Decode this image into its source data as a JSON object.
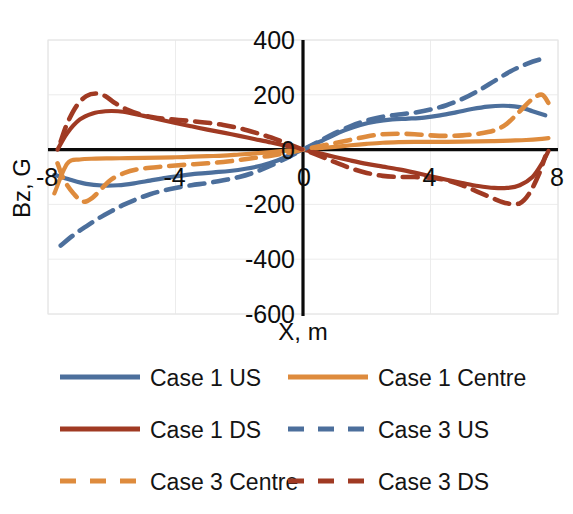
{
  "title_cut_off": "",
  "chart_data": {
    "type": "line",
    "title": "",
    "xlabel": "X, m",
    "ylabel": "Bz, G",
    "xlim": [
      -8,
      8
    ],
    "ylim": [
      -600,
      400
    ],
    "xticks": [
      "-8",
      "-4",
      "0",
      "4",
      "8"
    ],
    "xtick_values": [
      -8,
      -4,
      0,
      4,
      8
    ],
    "yticks": [
      "400",
      "200",
      "0",
      "-200",
      "-400",
      "-600"
    ],
    "ytick_values": [
      400,
      200,
      0,
      -200,
      -400,
      -600
    ],
    "grid": true,
    "legend_position": "bottom",
    "colors": {
      "blue": "#4C6F9C",
      "orange": "#DE8B3D",
      "darkred": "#A03A23"
    },
    "series": [
      {
        "name": "Case 1 US",
        "color": "#4C6F9C",
        "style": "solid",
        "x": [
          -7.8,
          -7.3,
          -6.8,
          -6.3,
          -5.8,
          -5.3,
          -4.8,
          -4.3,
          -3.8,
          -3.3,
          -2.8,
          -2.3,
          -1.8,
          -1.3,
          -0.8,
          -0.3,
          0,
          0.3,
          0.8,
          1.3,
          1.8,
          2.3,
          2.8,
          3.3,
          3.8,
          4.3,
          4.8,
          5.3,
          5.8,
          6.3,
          6.8,
          7.2,
          7.6
        ],
        "y": [
          -92,
          -110,
          -125,
          -131,
          -130,
          -123,
          -113,
          -103,
          -95,
          -88,
          -83,
          -78,
          -70,
          -58,
          -40,
          -14,
          0,
          16,
          44,
          70,
          90,
          103,
          110,
          113,
          117,
          125,
          136,
          148,
          157,
          160,
          155,
          140,
          125
        ]
      },
      {
        "name": "Case 1 Centre",
        "color": "#DE8B3D",
        "style": "solid",
        "x": [
          -7.8,
          -7.4,
          -7.0,
          -6.5,
          -6.0,
          -5.5,
          -5.0,
          -4.5,
          -4.0,
          -3.5,
          -3.0,
          -2.5,
          -2.0,
          -1.5,
          -1.0,
          -0.5,
          0,
          0.5,
          1.0,
          1.5,
          2.0,
          2.5,
          3.0,
          3.5,
          4.0,
          4.5,
          5.0,
          5.5,
          6.0,
          6.5,
          7.0,
          7.4,
          7.7
        ],
        "y": [
          -160,
          -52,
          -36,
          -33,
          -32,
          -31,
          -30,
          -29,
          -28,
          -26,
          -24,
          -22,
          -18,
          -14,
          -9,
          -4,
          0,
          5,
          10,
          16,
          21,
          25,
          27,
          28,
          28,
          28,
          29,
          30,
          31,
          33,
          35,
          38,
          42
        ]
      },
      {
        "name": "Case 1 DS",
        "color": "#A03A23",
        "style": "solid",
        "x": [
          -7.7,
          -7.4,
          -7.0,
          -6.6,
          -6.2,
          -5.8,
          -5.4,
          -5.0,
          -4.5,
          -4.0,
          -3.5,
          -3.0,
          -2.5,
          -2.0,
          -1.5,
          -1.0,
          -0.5,
          0,
          0.5,
          1.0,
          1.5,
          2.0,
          2.5,
          3.0,
          3.5,
          4.0,
          4.5,
          5.0,
          5.5,
          6.0,
          6.4,
          6.8,
          7.2,
          7.5,
          7.7
        ],
        "y": [
          0,
          60,
          110,
          132,
          140,
          140,
          133,
          123,
          110,
          97,
          85,
          73,
          62,
          50,
          38,
          26,
          13,
          0,
          -13,
          -27,
          -40,
          -52,
          -62,
          -72,
          -84,
          -97,
          -110,
          -122,
          -133,
          -140,
          -140,
          -130,
          -100,
          -50,
          -5
        ]
      },
      {
        "name": "Case 3 US",
        "color": "#4C6F9C",
        "style": "dashed",
        "x": [
          -7.6,
          -7.2,
          -6.8,
          -6.4,
          -6.0,
          -5.6,
          -5.2,
          -4.8,
          -4.4,
          -4.0,
          -3.5,
          -3.0,
          -2.5,
          -2.0,
          -1.5,
          -1.0,
          -0.5,
          0,
          0.5,
          1.0,
          1.5,
          2.0,
          2.5,
          3.0,
          3.5,
          4.0,
          4.5,
          5.0,
          5.5,
          6.0,
          6.5,
          7.0,
          7.4,
          7.6
        ],
        "y": [
          -350,
          -312,
          -280,
          -250,
          -224,
          -200,
          -180,
          -163,
          -150,
          -140,
          -130,
          -122,
          -112,
          -100,
          -82,
          -58,
          -30,
          0,
          30,
          60,
          86,
          106,
          120,
          128,
          135,
          146,
          162,
          185,
          215,
          250,
          285,
          312,
          328,
          330
        ]
      },
      {
        "name": "Case 3 Centre",
        "color": "#DE8B3D",
        "style": "dashed",
        "x": [
          -7.7,
          -7.5,
          -7.2,
          -6.9,
          -6.6,
          -6.3,
          -6.0,
          -5.6,
          -5.2,
          -4.8,
          -4.4,
          -4.0,
          -3.5,
          -3.0,
          -2.5,
          -2.0,
          -1.5,
          -1.0,
          -0.5,
          0,
          0.5,
          1.0,
          1.5,
          2.0,
          2.5,
          3.0,
          3.5,
          4.0,
          4.5,
          5.0,
          5.5,
          6.0,
          6.4,
          6.8,
          7.2,
          7.5,
          7.7
        ],
        "y": [
          -50,
          -110,
          -160,
          -190,
          -175,
          -140,
          -108,
          -85,
          -72,
          -66,
          -62,
          -58,
          -54,
          -50,
          -45,
          -38,
          -30,
          -22,
          -12,
          0,
          12,
          24,
          36,
          48,
          56,
          58,
          56,
          52,
          50,
          52,
          58,
          70,
          95,
          140,
          185,
          200,
          170
        ]
      },
      {
        "name": "Case 3 DS",
        "color": "#A03A23",
        "style": "dashed",
        "x": [
          -7.6,
          -7.4,
          -7.1,
          -6.8,
          -6.5,
          -6.2,
          -5.9,
          -5.5,
          -5.1,
          -4.7,
          -4.3,
          -3.9,
          -3.5,
          -3.0,
          -2.5,
          -2.0,
          -1.5,
          -1.0,
          -0.5,
          0,
          0.5,
          1.0,
          1.5,
          2.0,
          2.5,
          3.0,
          3.5,
          4.0,
          4.5,
          5.0,
          5.5,
          6.0,
          6.4,
          6.8,
          7.1,
          7.4,
          7.6
        ],
        "y": [
          30,
          95,
          160,
          195,
          205,
          195,
          170,
          145,
          128,
          118,
          112,
          108,
          104,
          98,
          90,
          78,
          62,
          44,
          22,
          0,
          -22,
          -46,
          -68,
          -85,
          -96,
          -100,
          -100,
          -103,
          -112,
          -130,
          -155,
          -180,
          -196,
          -196,
          -160,
          -90,
          -25
        ]
      }
    ]
  },
  "legend": {
    "entries": [
      {
        "label": "Case 1 US",
        "color": "#4C6F9C",
        "style": "solid",
        "column": 0,
        "row": 0
      },
      {
        "label": "Case 1 Centre",
        "color": "#DE8B3D",
        "style": "solid",
        "column": 1,
        "row": 0
      },
      {
        "label": "Case 1 DS",
        "color": "#A03A23",
        "style": "solid",
        "column": 0,
        "row": 1
      },
      {
        "label": "Case 3 US",
        "color": "#4C6F9C",
        "style": "dashed",
        "column": 1,
        "row": 1
      },
      {
        "label": "Case 3 Centre",
        "color": "#DE8B3D",
        "style": "dashed",
        "column": 0,
        "row": 2
      },
      {
        "label": "Case 3 DS",
        "color": "#A03A23",
        "style": "dashed",
        "column": 1,
        "row": 2
      }
    ]
  }
}
